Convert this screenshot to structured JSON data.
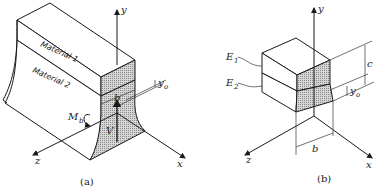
{
  "figure_a": {
    "caption": "(a)",
    "material_top": "Material 1",
    "material_bottom": "Material 2",
    "axis_x": "x",
    "axis_y": "y",
    "axis_z": "z",
    "moment_label": "M",
    "moment_sub": "b",
    "shear_label": "V",
    "width_label": "b",
    "offset_label": "y",
    "offset_sub": "o"
  },
  "figure_b": {
    "caption": "(b)",
    "modulus_top": "E",
    "modulus_top_sub": "1",
    "modulus_bottom": "E",
    "modulus_bottom_sub": "2",
    "axis_x": "x",
    "axis_y": "y",
    "axis_z": "z",
    "height_label": "c",
    "width_label": "b",
    "offset_label": "y",
    "offset_sub": "o"
  }
}
